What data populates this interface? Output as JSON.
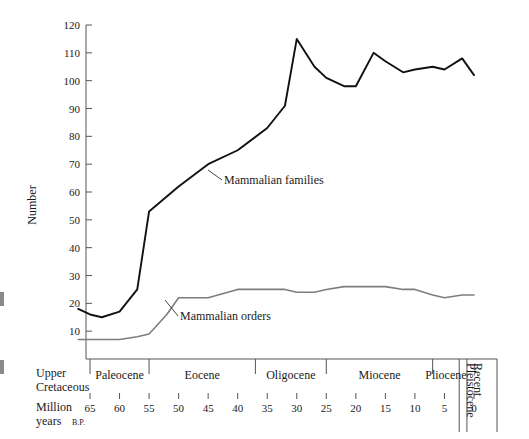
{
  "chart_data": {
    "type": "line",
    "title": "",
    "xlabel": "Million years B.P.",
    "ylabel": "Number",
    "xlim": [
      68,
      0
    ],
    "ylim": [
      0,
      120
    ],
    "x_inverted": true,
    "grid": false,
    "legend": "inline-annotations",
    "y_ticks": [
      10,
      20,
      30,
      40,
      50,
      60,
      70,
      80,
      90,
      100,
      110,
      120
    ],
    "x_ticks": [
      65,
      60,
      55,
      50,
      45,
      40,
      35,
      30,
      25,
      20,
      15,
      10,
      5,
      0
    ],
    "series": [
      {
        "name": "Mammalian families",
        "color": "#111111",
        "x": [
          67,
          65,
          63,
          60,
          57,
          55,
          50,
          45,
          40,
          35,
          32,
          30,
          27,
          25,
          22,
          20,
          17,
          15,
          12,
          10,
          7,
          5,
          2,
          0
        ],
        "values": [
          18,
          16,
          15,
          17,
          25,
          53,
          62,
          70,
          75,
          83,
          91,
          115,
          105,
          101,
          98,
          98,
          110,
          107,
          103,
          104,
          105,
          104,
          108,
          102
        ]
      },
      {
        "name": "Mammalian orders",
        "color": "#7d7d7d",
        "x": [
          67,
          65,
          60,
          57,
          55,
          52,
          50,
          45,
          40,
          35,
          32,
          30,
          27,
          25,
          22,
          20,
          17,
          15,
          12,
          10,
          7,
          5,
          2,
          0
        ],
        "values": [
          7,
          7,
          7,
          8,
          9,
          16,
          22,
          22,
          25,
          25,
          25,
          24,
          24,
          25,
          26,
          26,
          26,
          26,
          25,
          25,
          23,
          22,
          23,
          23
        ]
      }
    ],
    "annotations": [
      {
        "text": "Mammalian families",
        "x": 41,
        "y": 68
      },
      {
        "text": "Mammalian orders",
        "x": 40,
        "y": 18
      }
    ],
    "epochs": [
      {
        "label": "Upper Cretaceous",
        "start": 68,
        "end": 65,
        "rotated": false
      },
      {
        "label": "Paleocene",
        "start": 65,
        "end": 55,
        "rotated": false
      },
      {
        "label": "Eocene",
        "start": 55,
        "end": 37,
        "rotated": false
      },
      {
        "label": "Oligocene",
        "start": 37,
        "end": 25,
        "rotated": false
      },
      {
        "label": "Miocene",
        "start": 25,
        "end": 7,
        "rotated": false
      },
      {
        "label": "Pliocene",
        "start": 7,
        "end": 2.5,
        "rotated": false
      },
      {
        "label": "Pleistocene",
        "start": 2.5,
        "end": 1.2,
        "rotated": true
      },
      {
        "label": "Recent",
        "start": 1.2,
        "end": 0,
        "rotated": true
      }
    ],
    "axis_labels": {
      "y_axis_title": "Number",
      "x_axis_title_line1": "Million",
      "x_axis_title_line2": "years",
      "x_axis_title_suffix": "B.P."
    }
  },
  "colors": {
    "families_line": "#111111",
    "orders_line": "#7d7d7d",
    "axis": "#555555",
    "text": "#1a1a1a"
  }
}
